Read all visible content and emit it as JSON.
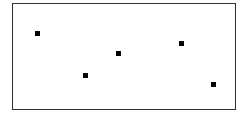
{
  "chart_data": {
    "type": "scatter",
    "title": "",
    "xlabel": "",
    "ylabel": "",
    "grid": false,
    "legend": null,
    "marker": "square",
    "marker_color": "#000000",
    "points": [
      {
        "x": 37,
        "y": 33
      },
      {
        "x": 85,
        "y": 75
      },
      {
        "x": 118,
        "y": 53
      },
      {
        "x": 181,
        "y": 43
      },
      {
        "x": 213,
        "y": 84
      }
    ]
  }
}
